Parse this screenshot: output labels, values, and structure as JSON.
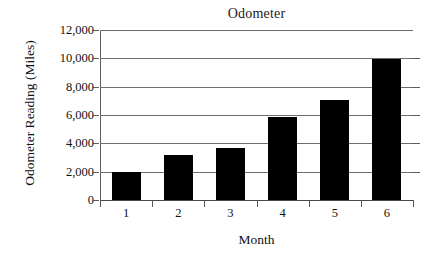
{
  "chart_data": {
    "type": "bar",
    "title": "Odometer",
    "xlabel": "Month",
    "ylabel": "Odometer Reading (Miles)",
    "categories": [
      "1",
      "2",
      "3",
      "4",
      "5",
      "6"
    ],
    "values": [
      2000,
      3150,
      3650,
      5850,
      7050,
      9950
    ],
    "ylim": [
      0,
      12000
    ],
    "ytick_values": [
      0,
      2000,
      4000,
      6000,
      8000,
      10000,
      12000
    ],
    "ytick_labels": [
      "0",
      "2,000",
      "4,000",
      "6,000",
      "8,000",
      "10,000",
      "12,000"
    ],
    "grid": true,
    "legend": false,
    "legend_position": "none",
    "bar_color": "#000000",
    "axis_color": "#5a5a5a",
    "gridline_color": "#6d6d6d",
    "background_color": "#ffffff"
  }
}
